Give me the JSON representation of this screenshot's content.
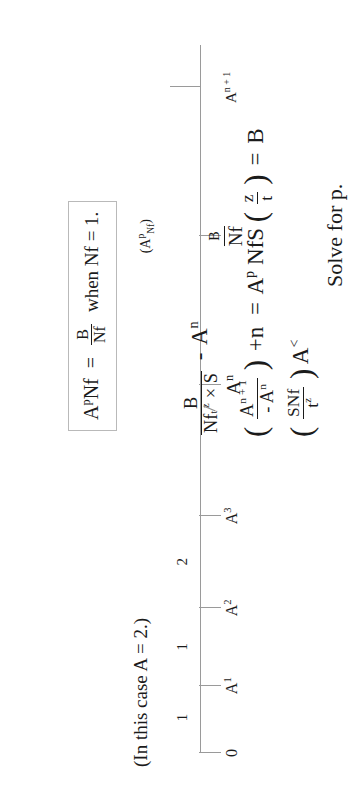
{
  "page": {
    "kind": "handwritten-math-note-scan",
    "orientation": "rotated-90-ccw",
    "ink_color": "#1b1b1b",
    "rule_color": "#9a9a9a"
  },
  "number_line": {
    "case_note": "(In this case A = 2.)",
    "origin_label": "0",
    "ticks": [
      {
        "label_text": "0",
        "label_base": "0",
        "label_exp": "",
        "pos_pct": 0
      },
      {
        "label_text": "A1",
        "label_base": "A",
        "label_exp": "1",
        "pos_pct": 9.5
      },
      {
        "label_text": "A2",
        "label_base": "A",
        "label_exp": "2",
        "pos_pct": 20.5
      },
      {
        "label_text": "A3",
        "label_base": "A",
        "label_exp": "3",
        "pos_pct": 33.5
      },
      {
        "label_text": "An",
        "label_base": "A",
        "label_exp": "n",
        "pos_pct": 52.0
      },
      {
        "label_text": "An+1",
        "label_base": "A",
        "label_exp": "n + 1",
        "pos_pct": 94.0
      }
    ],
    "gap_labels": [
      {
        "text": "1",
        "pos_pct": 5.0
      },
      {
        "text": "1",
        "pos_pct": 15.0
      },
      {
        "text": "2",
        "pos_pct": 27.0
      }
    ],
    "fraction_marker": {
      "numerator": "B",
      "denominator": "Nf",
      "pos_pct": 73.0,
      "paren_note_plain": "(A^p Nf)",
      "paren_note_prefix": "(A",
      "paren_note_sup": "p",
      "paren_note_sub": "Nf",
      "paren_note_suffix": ")"
    }
  },
  "work": {
    "boxed": {
      "lhs_base": "A",
      "lhs_sup": "p",
      "lhs_tail": "Nf",
      "equals": "=",
      "frac_num": "B",
      "frac_den": "Nf",
      "condition": "when Nf = 1."
    },
    "line_main": {
      "frac_num": "B",
      "den_nf": "Nf",
      "den_sfrac_num": "z",
      "den_sfrac_den": "t",
      "den_times": "× S",
      "minus": "-",
      "minus_term_base": "A",
      "minus_term_sup": "n"
    },
    "line_second": {
      "open_paren": "(",
      "frac_num_base": "A",
      "frac_num_sup": "n + 1",
      "frac_den_minus": "-",
      "frac_den_base": "A",
      "frac_den_sup": "n",
      "close_paren": ")",
      "plus_n": "+n",
      "equals": "=",
      "rhs_base": "A",
      "rhs_sup": "p",
      "rhs_nfs": "NfS",
      "rhs_paren_open": "(",
      "rhs_frac_num": "z",
      "rhs_frac_den": "t",
      "rhs_paren_close": ")",
      "rhs_equals": "=",
      "rhs_value": "B"
    },
    "line_third": {
      "open_paren": "(",
      "num": "SNf",
      "den_base": "t",
      "den_sup": "z",
      "close_paren": ")",
      "tail_base": "A",
      "tail_sup": "<"
    },
    "solve": "Solve for p."
  }
}
